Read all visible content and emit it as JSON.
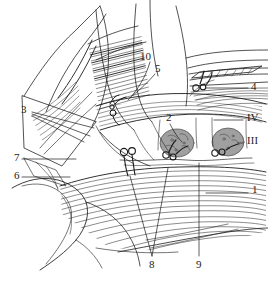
{
  "figure": {
    "type": "anatomical-line-drawing",
    "background_color": "#ffffff",
    "ink_color": "#1a1a1a",
    "shade_color": "#9a9a9a",
    "width": 268,
    "height": 282
  },
  "labels": [
    {
      "id": "label-1",
      "text": "1",
      "x": 252,
      "y": 190,
      "kind": "numeral"
    },
    {
      "id": "label-2",
      "text": "2",
      "x": 166,
      "y": 118,
      "kind": "numeral"
    },
    {
      "id": "label-3",
      "text": "3",
      "x": 21,
      "y": 110,
      "kind": "numeral"
    },
    {
      "id": "label-4",
      "text": "4",
      "x": 251,
      "y": 85,
      "kind": "numeral"
    },
    {
      "id": "label-5",
      "text": "5",
      "x": 155,
      "y": 69,
      "kind": "numeral"
    },
    {
      "id": "label-6",
      "text": "6",
      "x": 14,
      "y": 174,
      "kind": "numeral"
    },
    {
      "id": "label-7",
      "text": "7",
      "x": 14,
      "y": 156,
      "kind": "numeral"
    },
    {
      "id": "label-8",
      "text": "8",
      "x": 149,
      "y": 262,
      "kind": "numeral"
    },
    {
      "id": "label-9",
      "text": "9",
      "x": 197,
      "y": 262,
      "kind": "numeral"
    },
    {
      "id": "label-10",
      "text": "10",
      "x": 142,
      "y": 57,
      "kind": "numeral"
    },
    {
      "id": "label-iii",
      "text": "III",
      "x": 247,
      "y": 140,
      "kind": "roman"
    },
    {
      "id": "label-iv",
      "text": "IV",
      "x": 247,
      "y": 117,
      "kind": "roman"
    }
  ]
}
